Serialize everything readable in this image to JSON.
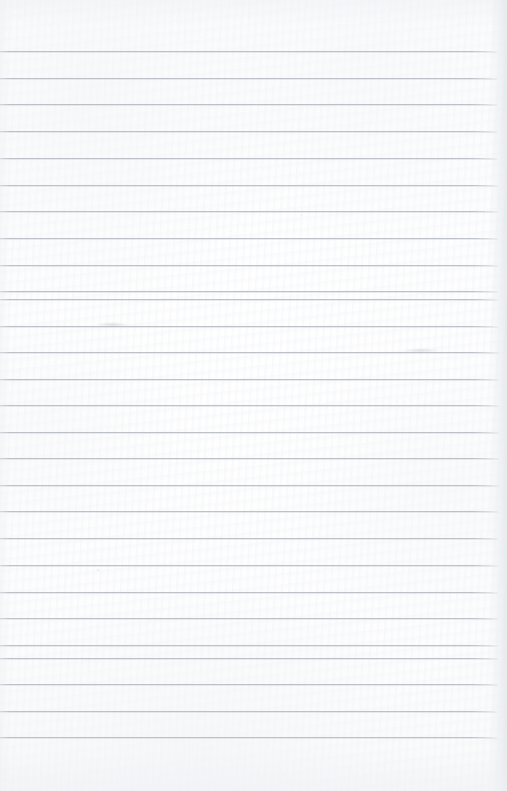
{
  "document": {
    "kind": "scanned-lined-notebook-page",
    "title": "Blank Ruled Notebook Page",
    "page_width": 507,
    "page_height": 791,
    "has_visible_text": false,
    "text_content": "",
    "paper_color": "#fdfdfe",
    "rule_color": "#b9bdc3",
    "edge_shadow_color": "#e4e7eb"
  },
  "ruling": {
    "line_count": 26,
    "first_line_y": 51,
    "line_spacing": 26.7,
    "line_thickness": 1,
    "line_start_x": 0,
    "line_end_x": 497,
    "top_margin": 51,
    "bottom_margin": 54,
    "lines": [
      {
        "index": 1,
        "y": 51,
        "x1": 0,
        "x2": 497
      },
      {
        "index": 2,
        "y": 78,
        "x1": 0,
        "x2": 497
      },
      {
        "index": 3,
        "y": 104,
        "x1": 0,
        "x2": 497
      },
      {
        "index": 4,
        "y": 131,
        "x1": 0,
        "x2": 497
      },
      {
        "index": 5,
        "y": 158,
        "x1": 0,
        "x2": 497
      },
      {
        "index": 6,
        "y": 185,
        "x1": 0,
        "x2": 498
      },
      {
        "index": 7,
        "y": 211,
        "x1": 0,
        "x2": 498
      },
      {
        "index": 8,
        "y": 238,
        "x1": 0,
        "x2": 498
      },
      {
        "index": 9,
        "y": 265,
        "x1": 0,
        "x2": 498
      },
      {
        "index": 10,
        "y": 291,
        "x1": 0,
        "x2": 498
      },
      {
        "index": 11,
        "y": 299,
        "x1": 0,
        "x2": 498
      },
      {
        "index": 12,
        "y": 326,
        "x1": 0,
        "x2": 498
      },
      {
        "index": 13,
        "y": 352,
        "x1": 0,
        "x2": 499
      },
      {
        "index": 14,
        "y": 379,
        "x1": 0,
        "x2": 499
      },
      {
        "index": 15,
        "y": 405,
        "x1": 0,
        "x2": 499
      },
      {
        "index": 16,
        "y": 432,
        "x1": 0,
        "x2": 499
      },
      {
        "index": 17,
        "y": 458,
        "x1": 0,
        "x2": 499
      },
      {
        "index": 18,
        "y": 485,
        "x1": 0,
        "x2": 499
      },
      {
        "index": 19,
        "y": 511,
        "x1": 0,
        "x2": 499
      },
      {
        "index": 20,
        "y": 538,
        "x1": 0,
        "x2": 498
      },
      {
        "index": 21,
        "y": 565,
        "x1": 0,
        "x2": 498
      },
      {
        "index": 22,
        "y": 592,
        "x1": 0,
        "x2": 498
      },
      {
        "index": 23,
        "y": 618,
        "x1": 0,
        "x2": 498
      },
      {
        "index": 24,
        "y": 645,
        "x1": 0,
        "x2": 498
      },
      {
        "index": 25,
        "y": 658,
        "x1": 0,
        "x2": 498
      },
      {
        "index": 26,
        "y": 684,
        "x1": 0,
        "x2": 498
      },
      {
        "index": 27,
        "y": 711,
        "x1": 0,
        "x2": 497
      },
      {
        "index": 28,
        "y": 737,
        "x1": 0,
        "x2": 497
      }
    ]
  },
  "marks": [
    {
      "name": "pencil-smudge-left",
      "x": 95,
      "y": 322,
      "width": 34,
      "height": 5,
      "opacity": 0.3,
      "color": "#9aa0a8"
    },
    {
      "name": "pencil-smudge-right",
      "x": 402,
      "y": 348,
      "width": 38,
      "height": 5,
      "opacity": 0.26,
      "color": "#9ba1a9"
    },
    {
      "name": "pencil-dot-mid",
      "x": 96,
      "y": 568,
      "width": 4,
      "height": 4,
      "opacity": 0.22,
      "color": "#a8aeb6"
    },
    {
      "name": "paper-speck-upper",
      "x": 300,
      "y": 214,
      "width": 3,
      "height": 3,
      "opacity": 0.18,
      "color": "#aab0b8"
    }
  ]
}
